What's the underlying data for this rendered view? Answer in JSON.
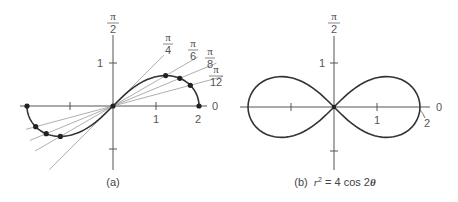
{
  "panels": [
    {
      "id": "a",
      "caption": "(a)",
      "origin_px": [
        113,
        106
      ],
      "scale_px_per_unit": 43,
      "axis_labels": {
        "polar_axis": "0",
        "vertical_num": "π",
        "vertical_den": "2"
      },
      "tick_labels": {
        "x1": "1",
        "x2": "2",
        "y1": "1"
      },
      "rays": [
        {
          "angle": "π/4",
          "num": "π",
          "den": "4",
          "theta": 0.785398
        },
        {
          "angle": "π/6",
          "num": "π",
          "den": "6",
          "theta": 0.523599
        },
        {
          "angle": "π/8",
          "num": "π",
          "den": "8",
          "theta": 0.392699
        },
        {
          "angle": "π/12",
          "num": "π",
          "den": "12",
          "theta": 0.261799
        }
      ],
      "points": [
        {
          "theta": "0",
          "r": 2
        },
        {
          "theta": "π/12",
          "r": 1.861
        },
        {
          "theta": "π/8",
          "r": 1.682
        },
        {
          "theta": "π/6",
          "r": 1.414
        },
        {
          "theta": "π/4",
          "r": 0
        }
      ]
    },
    {
      "id": "b",
      "caption_prefix": "(b)",
      "caption_eq_r": "r",
      "caption_eq_sup": "2",
      "caption_eq_rest": " = 4 cos 2",
      "caption_eq_theta": "θ",
      "origin_px": [
        334,
        107
      ],
      "scale_px_per_unit": 43,
      "axis_labels": {
        "polar_axis": "0",
        "vertical_num": "π",
        "vertical_den": "2"
      },
      "tick_labels": {
        "x1": "1",
        "x2": "2",
        "y1": "1"
      },
      "equation": "r² = 4 cos 2θ"
    }
  ]
}
